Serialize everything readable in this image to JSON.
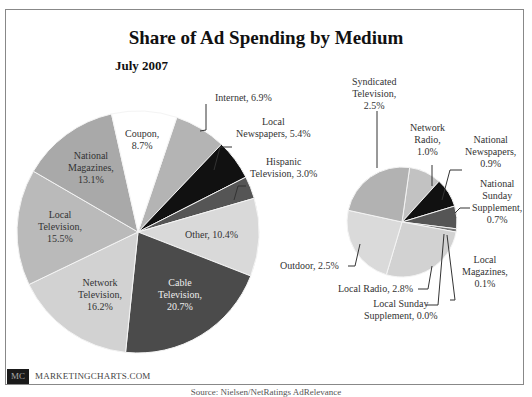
{
  "chart_data": [
    {
      "type": "pie",
      "title": "Share of Ad Spending by Medium",
      "subtitle": "July 2007",
      "name": "main",
      "center": [
        138,
        232
      ],
      "radius": 121,
      "start_angle_deg": 18.7,
      "categories": [
        "Internet",
        "Local Newspapers",
        "Hispanic Television",
        "Other",
        "Cable Television",
        "Network Television",
        "Local Television",
        "National Magazines",
        "Coupon"
      ],
      "values": [
        6.9,
        5.4,
        3.0,
        10.4,
        20.7,
        16.2,
        15.5,
        13.1,
        8.7
      ],
      "colors": [
        "#b4b4b4",
        "#111111",
        "#555555",
        "#d9d9d9",
        "#4b4b4b",
        "#d2d2d2",
        "#bababa",
        "#a9a9a9",
        "#ffffff"
      ],
      "unit": "%"
    },
    {
      "type": "pie",
      "name": "other-breakdown",
      "center": [
        402,
        222
      ],
      "radius": 55,
      "start_angle_deg": 8,
      "categories": [
        "Network Radio",
        "National Newspapers",
        "National Sunday Supplement",
        "Local Magazines",
        "Local Sunday Supplement",
        "Local Radio",
        "Outdoor",
        "Syndicated Television"
      ],
      "values": [
        1.0,
        0.9,
        0.7,
        0.1,
        0.0,
        2.8,
        2.5,
        2.5
      ],
      "colors": [
        "#c2c2c2",
        "#111111",
        "#555555",
        "#777777",
        "#999999",
        "#d2d2d2",
        "#dadada",
        "#b2b2b2"
      ],
      "unit": "%"
    }
  ],
  "header": {
    "title": "Share of Ad Spending by Medium",
    "subtitle": "July 2007"
  },
  "labels": {
    "internet": "Internet, 6.9%",
    "local_newspapers": [
      "Local",
      "Newspapers, 5.4%"
    ],
    "hispanic": [
      "Hispanic",
      "Television, 3.0%"
    ],
    "coupon": [
      "Coupon,",
      "8.7%"
    ],
    "national_magazines": [
      "National",
      "Magazines,",
      "13.1%"
    ],
    "local_tv": [
      "Local",
      "Television,",
      "15.5%"
    ],
    "other": "Other, 10.4%",
    "network_tv": [
      "Network",
      "Television,",
      "16.2%"
    ],
    "cable": [
      "Cable",
      "Television,",
      "20.7%"
    ],
    "syndicated": [
      "Syndicated",
      "Television,",
      "2.5%"
    ],
    "network_radio": [
      "Network",
      "Radio,",
      "1.0%"
    ],
    "national_newspapers": [
      "National",
      "Newspapers,",
      "0.9%"
    ],
    "national_sunday": [
      "National",
      "Sunday",
      "Supplement,",
      "0.7%"
    ],
    "local_magazines": [
      "Local",
      "Magazines,",
      "0.1%"
    ],
    "outdoor": "Outdoor, 2.5%",
    "local_radio": "Local Radio, 2.8%",
    "local_sunday": [
      "Local Sunday",
      "Supplement, 0.0%"
    ]
  },
  "brand": {
    "logo": "MC",
    "text": "MARKETINGCHARTS.COM"
  },
  "source": "Source: Nielsen/NetRatings AdRelevance"
}
